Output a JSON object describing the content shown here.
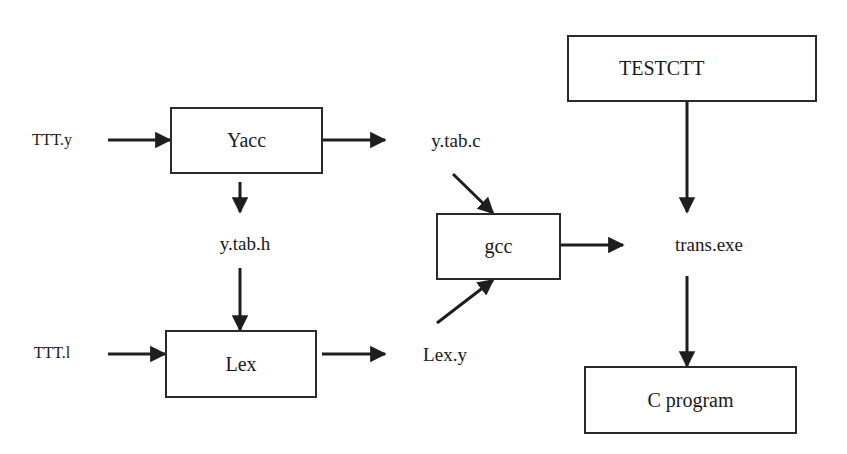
{
  "diagram": {
    "type": "flowchart",
    "nodes": {
      "yacc": {
        "label": "Yacc"
      },
      "lex": {
        "label": "Lex"
      },
      "gcc": {
        "label": "gcc"
      },
      "testctt": {
        "label": "TESTCTT"
      },
      "c_program": {
        "label": "C program"
      }
    },
    "labels": {
      "ttt_y": "TTT.y",
      "ttt_l": "TTT.l",
      "y_tab_c": "y.tab.c",
      "y_tab_h": "y.tab.h",
      "lex_y": "Lex.y",
      "trans_exe": "trans.exe"
    },
    "edges": [
      {
        "from": "TTT.y",
        "to": "Yacc"
      },
      {
        "from": "Yacc",
        "to": "y.tab.c"
      },
      {
        "from": "Yacc",
        "to": "y.tab.h"
      },
      {
        "from": "y.tab.h",
        "to": "Lex"
      },
      {
        "from": "TTT.l",
        "to": "Lex"
      },
      {
        "from": "Lex",
        "to": "Lex.y"
      },
      {
        "from": "y.tab.c",
        "to": "gcc"
      },
      {
        "from": "Lex.y",
        "to": "gcc"
      },
      {
        "from": "gcc",
        "to": "trans.exe"
      },
      {
        "from": "TESTCTT",
        "to": "trans.exe"
      },
      {
        "from": "trans.exe",
        "to": "C program"
      }
    ]
  }
}
